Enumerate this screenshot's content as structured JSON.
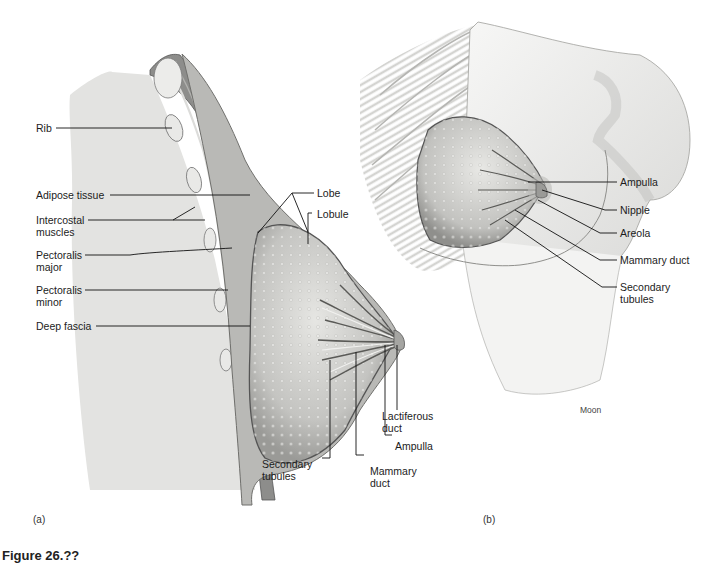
{
  "figure": {
    "caption_partial": "Figure 26.??",
    "credit": "Moon",
    "panels": [
      {
        "tag": "(a)",
        "view": "sagittal section"
      },
      {
        "tag": "(b)",
        "view": "anterior view"
      }
    ]
  },
  "panel_a": {
    "labels_left": [
      {
        "id": "rib",
        "line1": "Rib",
        "line2": ""
      },
      {
        "id": "adipose",
        "line1": "Adipose tissue",
        "line2": ""
      },
      {
        "id": "intercostal",
        "line1": "Intercostal",
        "line2": "muscles"
      },
      {
        "id": "pect-major",
        "line1": "Pectoralis",
        "line2": "major"
      },
      {
        "id": "pect-minor",
        "line1": "Pectoralis",
        "line2": "minor"
      },
      {
        "id": "deep-fascia",
        "line1": "Deep fascia",
        "line2": ""
      }
    ],
    "labels_top": [
      {
        "id": "lobe",
        "line1": "Lobe"
      },
      {
        "id": "lobule",
        "line1": "Lobule"
      }
    ],
    "labels_bottom": [
      {
        "id": "lactiferous",
        "line1": "Lactiferous",
        "line2": "duct"
      },
      {
        "id": "ampulla",
        "line1": "Ampulla",
        "line2": ""
      },
      {
        "id": "secondary",
        "line1": "Secondary",
        "line2": "tubules"
      },
      {
        "id": "mammary",
        "line1": "Mammary",
        "line2": "duct"
      }
    ]
  },
  "panel_b": {
    "labels_right": [
      {
        "id": "ampulla",
        "line1": "Ampulla",
        "line2": ""
      },
      {
        "id": "nipple",
        "line1": "Nipple",
        "line2": ""
      },
      {
        "id": "areola",
        "line1": "Areola",
        "line2": ""
      },
      {
        "id": "mammary",
        "line1": "Mammary duct",
        "line2": ""
      },
      {
        "id": "secondary",
        "line1": "Secondary",
        "line2": "tubules"
      }
    ]
  },
  "colors": {
    "background": "#ffffff",
    "lung": "#e4e4e2",
    "muscle": "#8c8c8c",
    "gland": "#c9c9c6",
    "skin": "#d8d8d6",
    "leader": "#111111"
  }
}
